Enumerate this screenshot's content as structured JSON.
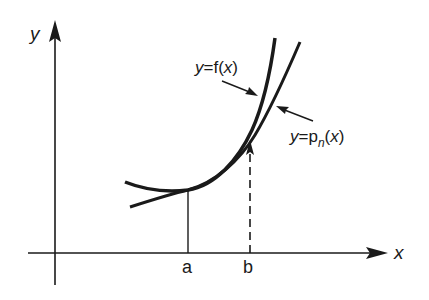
{
  "axes": {
    "x_label": "x",
    "y_label": "y"
  },
  "points": {
    "a": "a",
    "b": "b"
  },
  "curves": {
    "f": {
      "prefix": "y",
      "eq": "=",
      "name": "f",
      "open": "(",
      "var": "x",
      "close": ")"
    },
    "p": {
      "prefix": "y",
      "eq": "=",
      "name": "p",
      "subscript": "n",
      "open": "(",
      "var": "x",
      "close": ")"
    }
  },
  "colors": {
    "ink": "#1a1a1a",
    "background": "#ffffff"
  }
}
